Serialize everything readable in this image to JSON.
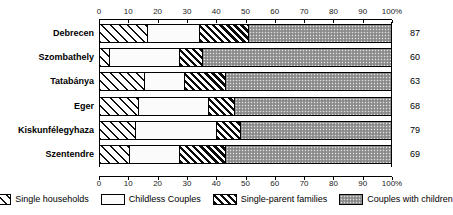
{
  "chart_data": {
    "type": "bar",
    "orientation": "horizontal",
    "stacked": true,
    "normalized": true,
    "title": "",
    "subtitle": "",
    "xlabel": "",
    "ylabel": "",
    "xlim": [
      0,
      100
    ],
    "xtick_labels": [
      "0",
      "10",
      "20",
      "30",
      "40",
      "50",
      "60",
      "70",
      "80",
      "90",
      "100%"
    ],
    "xticks": [
      0,
      10,
      20,
      30,
      40,
      50,
      60,
      70,
      80,
      90,
      100
    ],
    "grid": false,
    "axis_position": "top",
    "legend_position": "bottom",
    "categories": [
      "Debrecen",
      "Szombathely",
      "Tatabánya",
      "Eger",
      "Kiskunfélegyhaza",
      "Szentendre"
    ],
    "row_values": [
      "87",
      "60",
      "63",
      "68",
      "79",
      "69"
    ],
    "series": [
      {
        "name": "Single households",
        "pattern": "diagonal-hatch-wide",
        "values": [
          16,
          3,
          15,
          13,
          12,
          10
        ]
      },
      {
        "name": "Childless Couples",
        "pattern": "dotted-light",
        "values": [
          18,
          24,
          14,
          24,
          28,
          17
        ]
      },
      {
        "name": "Single-parent families",
        "pattern": "diagonal-hatch-dense",
        "values": [
          17,
          8,
          14,
          9,
          8,
          16
        ]
      },
      {
        "name": "Couples with children",
        "pattern": "checker-grey",
        "values": [
          49,
          65,
          57,
          54,
          52,
          57
        ]
      }
    ]
  },
  "legend": {
    "items": [
      {
        "label": "Single households",
        "swatch": "diagonal-hatch-wide"
      },
      {
        "label": "Childless Couples",
        "swatch": "dotted-light"
      },
      {
        "label": "Single-parent families",
        "swatch": "diagonal-hatch-dense"
      },
      {
        "label": "Couples with children",
        "swatch": "checker-grey"
      }
    ]
  }
}
